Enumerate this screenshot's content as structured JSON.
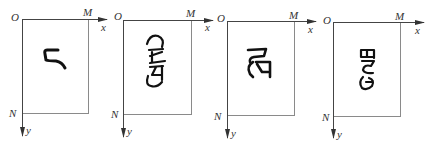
{
  "diagram": {
    "colors": {
      "frame": "#8a8a8a",
      "axis": "#444444",
      "glyph": "#111111",
      "label": "#333333",
      "background": "#ffffff"
    },
    "panels": [
      {
        "origin_label": "O",
        "x_corner_label": "M",
        "y_corner_label": "N",
        "x_axis_label": "x",
        "y_axis_label": "y",
        "character": "ང",
        "orientation": "upright"
      },
      {
        "origin_label": "O",
        "x_corner_label": "M",
        "y_corner_label": "N",
        "x_axis_label": "x",
        "y_axis_label": "y",
        "character": "stacked Tibetan syllable",
        "orientation": "rotated 90°"
      },
      {
        "origin_label": "O",
        "x_corner_label": "M",
        "y_corner_label": "N",
        "x_axis_label": "x",
        "y_axis_label": "y",
        "character": "Tibetan syllable (two letters)",
        "orientation": "upright"
      },
      {
        "origin_label": "O",
        "x_corner_label": "M",
        "y_corner_label": "N",
        "x_axis_label": "x",
        "y_axis_label": "y",
        "character": "stacked Tibetan syllable",
        "orientation": "rotated 90°"
      }
    ]
  }
}
